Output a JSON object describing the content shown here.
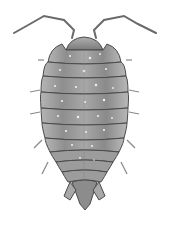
{
  "image": {
    "subject": "isopod (woodlouse) dorsal view illustration",
    "style": "grayscale scientific drawing",
    "background": "#ffffff",
    "colors": {
      "body_dark": "#6b6b6b",
      "body_mid": "#9a9a9a",
      "body_light": "#c8c8c8",
      "outline": "#4a4a4a",
      "speckle": "#f2f2f2"
    },
    "parts": {
      "antennae": 2,
      "head": 1,
      "pereon_segments": 7,
      "pleon_segments": 3,
      "uropods": 2
    }
  }
}
